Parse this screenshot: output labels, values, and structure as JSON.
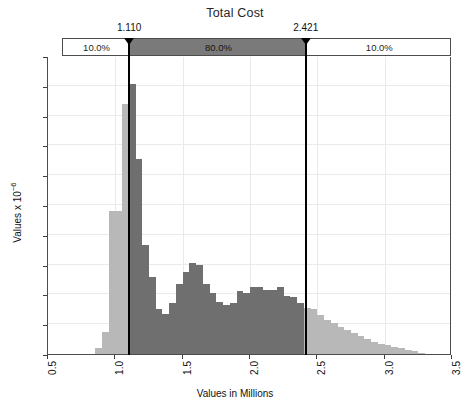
{
  "chart_data": {
    "type": "bar",
    "title": "Total Cost",
    "xlabel": "Values in Millions",
    "ylabel": "Values x 10−6",
    "ylabel_base": "Values x 10",
    "ylabel_exp": "−6",
    "xlim": [
      0.5,
      3.5
    ],
    "ylim": [
      0.0,
      2.0
    ],
    "grid": true,
    "legend": null,
    "bin_width": 0.05,
    "xticks": [
      0.5,
      1.0,
      1.5,
      2.0,
      2.5,
      3.0,
      3.5
    ],
    "xtick_labels": [
      "0.5",
      "1.0",
      "1.5",
      "2.0",
      "2.5",
      "3.0",
      "3.5"
    ],
    "yticks": [
      0.0,
      0.2,
      0.4,
      0.6,
      0.8,
      1.0,
      1.2,
      1.4,
      1.6,
      1.8,
      2.0
    ],
    "ytick_labels": [
      "0.0",
      "0.2",
      "0.4",
      "0.6",
      "0.8",
      "1.0",
      "1.2",
      "1.4",
      "1.6",
      "1.8",
      "2.0"
    ],
    "categories": [
      0.875,
      0.925,
      0.975,
      1.025,
      1.075,
      1.125,
      1.175,
      1.225,
      1.275,
      1.325,
      1.375,
      1.425,
      1.475,
      1.525,
      1.575,
      1.625,
      1.675,
      1.725,
      1.775,
      1.825,
      1.875,
      1.925,
      1.975,
      2.025,
      2.075,
      2.125,
      2.175,
      2.225,
      2.275,
      2.325,
      2.375,
      2.425,
      2.475,
      2.525,
      2.575,
      2.625,
      2.675,
      2.725,
      2.775,
      2.825,
      2.875,
      2.925,
      2.975,
      3.025,
      3.075,
      3.125,
      3.175,
      3.225,
      3.275
    ],
    "values": [
      0.04,
      0.15,
      0.96,
      0.96,
      1.68,
      1.81,
      1.31,
      0.73,
      0.52,
      0.3,
      0.27,
      0.34,
      0.47,
      0.55,
      0.61,
      0.6,
      0.47,
      0.41,
      0.35,
      0.33,
      0.34,
      0.42,
      0.41,
      0.45,
      0.45,
      0.43,
      0.43,
      0.45,
      0.39,
      0.38,
      0.34,
      0.31,
      0.3,
      0.26,
      0.23,
      0.21,
      0.18,
      0.16,
      0.14,
      0.12,
      0.1,
      0.08,
      0.07,
      0.06,
      0.05,
      0.04,
      0.03,
      0.02,
      0.01
    ],
    "series_note": "Frequency density histogram of simulated Total Cost values",
    "highlight_range": [
      1.11,
      2.421
    ],
    "bar_color_in_range": "#6f6f6f",
    "bar_color_out_of_range": "#b8b8b8",
    "gridline_color": "#eaeaea",
    "axis_color": "#4d4d4d",
    "marker_line_color": "#000000"
  },
  "certainty_band": {
    "segments": [
      {
        "label": "10.0%",
        "from": 0.5,
        "to": 1.11,
        "highlighted": false
      },
      {
        "label": "80.0%",
        "from": 1.11,
        "to": 2.421,
        "highlighted": true
      },
      {
        "label": "10.0%",
        "from": 2.421,
        "to": 3.5,
        "highlighted": false
      }
    ],
    "markers": [
      {
        "name": "lower-bound-marker",
        "label": "1.110",
        "value": 1.11
      },
      {
        "name": "upper-bound-marker",
        "label": "2.421",
        "value": 2.421
      }
    ]
  }
}
